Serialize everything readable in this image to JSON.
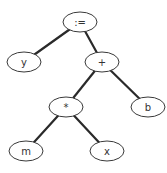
{
  "diagram": {
    "type": "expression-tree",
    "nodes": [
      {
        "id": "assign",
        "label": ":="
      },
      {
        "id": "y",
        "label": "y"
      },
      {
        "id": "plus",
        "label": "+"
      },
      {
        "id": "times",
        "label": "*"
      },
      {
        "id": "b",
        "label": "b"
      },
      {
        "id": "m",
        "label": "m"
      },
      {
        "id": "x",
        "label": "x"
      }
    ],
    "edges": [
      {
        "from": "assign",
        "to": "y"
      },
      {
        "from": "assign",
        "to": "plus"
      },
      {
        "from": "plus",
        "to": "times"
      },
      {
        "from": "plus",
        "to": "b"
      },
      {
        "from": "times",
        "to": "m"
      },
      {
        "from": "times",
        "to": "x"
      }
    ]
  }
}
